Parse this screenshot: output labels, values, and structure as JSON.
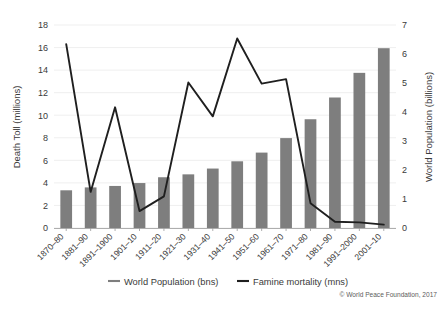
{
  "chart_data": {
    "type": "bar",
    "title": "",
    "subtitle": "",
    "xlabel": "",
    "ylabel": "Death Toll (millions)",
    "y2label": "World Population (billions)",
    "grid": true,
    "legend_position": "bottom",
    "ylim": [
      0,
      18
    ],
    "y2lim": [
      0,
      7
    ],
    "yticks": [
      "0",
      "2",
      "4",
      "6",
      "8",
      "10",
      "12",
      "14",
      "16",
      "18"
    ],
    "y2ticks": [
      "0",
      "1",
      "2",
      "3",
      "4",
      "5",
      "6",
      "7"
    ],
    "categories": [
      "1870–80",
      "1881–90",
      "1891–1900",
      "1901–10",
      "1911–20",
      "1921–30",
      "1931–40",
      "1941–50",
      "1951–60",
      "1961–70",
      "1971–80",
      "1981–90",
      "1991–2000",
      "2001–10"
    ],
    "series": [
      {
        "name": "World Population (bns)",
        "type": "bar",
        "axis": "right",
        "unit": "billions",
        "color": "#7e7e7e",
        "values": [
          1.3,
          1.4,
          1.45,
          1.55,
          1.75,
          1.85,
          2.05,
          2.3,
          2.6,
          3.1,
          3.75,
          4.5,
          5.35,
          6.2
        ]
      },
      {
        "name": "Famine mortality (mns)",
        "type": "line",
        "axis": "left",
        "unit": "millions",
        "color": "#1f1f1f",
        "values": [
          16.3,
          3.2,
          10.7,
          1.5,
          2.8,
          12.9,
          9.9,
          16.8,
          12.8,
          13.2,
          2.2,
          0.55,
          0.5,
          0.3
        ]
      }
    ],
    "annotations": [
      "© World Peace Foundation, 2017"
    ]
  },
  "legend": {
    "items": [
      {
        "label": "World Population (bns)",
        "color": "#7e7e7e"
      },
      {
        "label": "Famine mortality (mns)",
        "color": "#1f1f1f"
      }
    ]
  },
  "credit": "© World Peace Foundation, 2017"
}
